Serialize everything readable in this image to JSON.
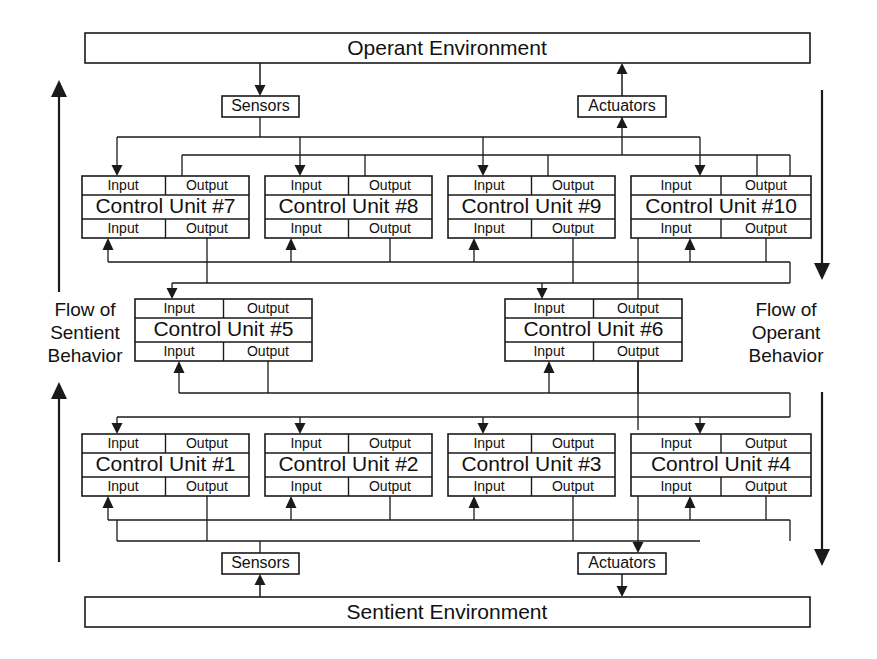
{
  "diagram": {
    "title_top": "Operant Environment",
    "title_bottom": "Sentient Environment",
    "sensors_label": "Sensors",
    "actuators_label": "Actuators",
    "io_input": "Input",
    "io_output": "Output",
    "colors": {
      "line": "#1a1a1a",
      "fill": "#ffffff",
      "text": "#111111"
    },
    "flow_left": {
      "line1": "Flow of",
      "line2": "Sentient",
      "line3": "Behavior"
    },
    "flow_right": {
      "line1": "Flow of",
      "line2": "Operant",
      "line3": "Behavior"
    },
    "top_environment": {
      "label": "Operant Environment",
      "x": 85,
      "y": 33,
      "w": 725,
      "h": 30
    },
    "bottom_environment": {
      "label": "Sentient Environment",
      "x": 85,
      "y": 597,
      "w": 725,
      "h": 30
    },
    "sensors_top": {
      "label": "Sensors",
      "x": 222,
      "y": 96,
      "w": 77,
      "h": 21
    },
    "actuators_top": {
      "label": "Actuators",
      "x": 578,
      "y": 96,
      "w": 88,
      "h": 21
    },
    "sensors_bottom": {
      "label": "Sensors",
      "x": 222,
      "y": 553,
      "w": 77,
      "h": 21
    },
    "actuators_bottom": {
      "label": "Actuators",
      "x": 578,
      "y": 553,
      "w": 88,
      "h": 21
    },
    "units": [
      {
        "label": "Control Unit #7",
        "x": 82,
        "y": 176,
        "w": 167,
        "h": 62,
        "row": "upper"
      },
      {
        "label": "Control Unit #8",
        "x": 265,
        "y": 176,
        "w": 167,
        "h": 62,
        "row": "upper"
      },
      {
        "label": "Control Unit #9",
        "x": 448,
        "y": 176,
        "w": 167,
        "h": 62,
        "row": "upper"
      },
      {
        "label": "Control Unit #10",
        "x": 631,
        "y": 176,
        "w": 180,
        "h": 62,
        "row": "upper"
      },
      {
        "label": "Control Unit #5",
        "x": 135,
        "y": 299,
        "w": 177,
        "h": 62,
        "row": "middle"
      },
      {
        "label": "Control Unit #6",
        "x": 505,
        "y": 299,
        "w": 177,
        "h": 62,
        "row": "middle"
      },
      {
        "label": "Control Unit #1",
        "x": 82,
        "y": 434,
        "w": 167,
        "h": 62,
        "row": "lower"
      },
      {
        "label": "Control Unit #2",
        "x": 265,
        "y": 434,
        "w": 167,
        "h": 62,
        "row": "lower"
      },
      {
        "label": "Control Unit #3",
        "x": 448,
        "y": 434,
        "w": 167,
        "h": 62,
        "row": "lower"
      },
      {
        "label": "Control Unit #4",
        "x": 631,
        "y": 434,
        "w": 180,
        "h": 62,
        "row": "lower"
      }
    ],
    "side_arrows": {
      "left_upper": {
        "x": 59,
        "y_from": 292,
        "y_to": 80,
        "direction": "up"
      },
      "left_lower": {
        "x": 59,
        "y_from": 562,
        "y_to": 382,
        "direction": "up"
      },
      "right_upper": {
        "x": 822,
        "y_from": 90,
        "y_to": 280,
        "direction": "down"
      },
      "right_lower": {
        "x": 822,
        "y_from": 392,
        "y_to": 566,
        "direction": "down"
      }
    }
  }
}
